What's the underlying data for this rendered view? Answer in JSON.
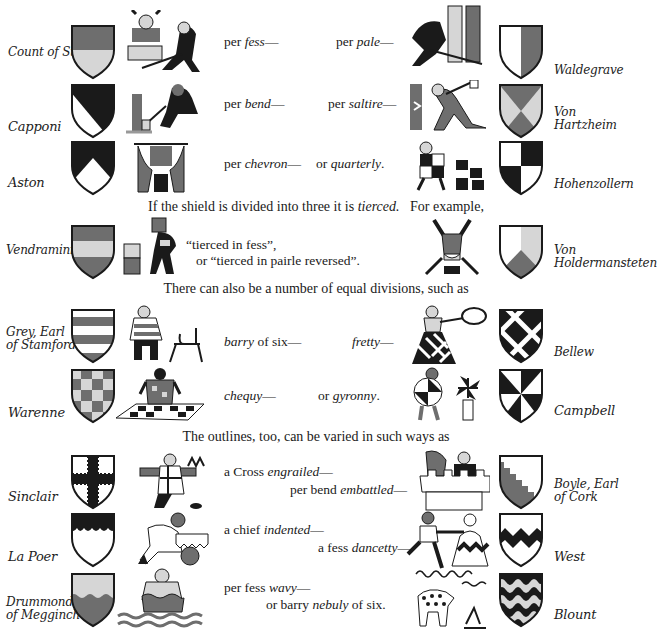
{
  "colors": {
    "ink": "#1a1a1a",
    "red": "#6e6e6e",
    "light": "#d6d6d6",
    "white": "#ffffff"
  },
  "rows": [
    {
      "left_name": "Count of Stockau",
      "left_pattern": "per-fess",
      "cap_left_pre": "per ",
      "cap_left_em": "fess",
      "cap_left_post": "—",
      "cap_right_pre": "per ",
      "cap_right_em": "pale",
      "cap_right_post": "—",
      "right_name": "Waldegrave",
      "right_pattern": "per-pale"
    },
    {
      "left_name": "Capponi",
      "left_pattern": "per-bend",
      "cap_left_pre": "per ",
      "cap_left_em": "bend",
      "cap_left_post": "—",
      "cap_right_pre": "per ",
      "cap_right_em": "saltire",
      "cap_right_post": "—",
      "right_name": "Von Hartzheim",
      "right_pattern": "per-saltire"
    },
    {
      "left_name": "Aston",
      "left_pattern": "per-chevron",
      "cap_left_pre": "per ",
      "cap_left_em": "chevron",
      "cap_left_post": "—",
      "cap_right_pre": "or ",
      "cap_right_em": "quarterly",
      "cap_right_post": ".",
      "right_name": "Hohenzollern",
      "right_pattern": "quarterly"
    }
  ],
  "tierced_intro": {
    "pre": "If the shield is divided into three it is ",
    "em": "tierced.",
    "post": "   For example,"
  },
  "tierced": {
    "left_name": "Vendramini",
    "left_pattern": "tierced-in-fess",
    "line1": "“tierced in fess”,",
    "line2": "or “tierced in pairle reversed”.",
    "right_name_1": "Von",
    "right_name_2": "Holdermansteten",
    "right_pattern": "tierced-in-pairle-reversed"
  },
  "divisions_intro": "There can also be a number of equal divisions, such as",
  "divisions": [
    {
      "left_name_1": "Grey, Earl",
      "left_name_2": "of Stamford",
      "left_pattern": "barry-of-six",
      "cap_left_em": "barry",
      "cap_left_post": " of six—",
      "cap_right_pre": "",
      "cap_right_em": "fretty",
      "cap_right_post": "—",
      "right_name": "Bellew",
      "right_pattern": "fretty"
    },
    {
      "left_name": "Warenne",
      "left_pattern": "chequy",
      "cap_left_em": "chequy",
      "cap_left_post": "—",
      "cap_right_pre": "or ",
      "cap_right_em": "gyronny",
      "cap_right_post": ".",
      "right_name": "Campbell",
      "right_pattern": "gyronny"
    }
  ],
  "outlines_intro": "The outlines, too, can be varied in such ways as",
  "outlines": [
    {
      "left_name": "Sinclair",
      "left_pattern": "cross-engrailed",
      "cap1_pre": "a Cross ",
      "cap1_em": "engrailed",
      "cap1_post": "—",
      "cap2_pre": "per bend ",
      "cap2_em": "embattled",
      "cap2_post": "—",
      "right_name_1": "Boyle, Earl",
      "right_name_2": "of Cork",
      "right_pattern": "per-bend-embattled"
    },
    {
      "left_name": "La Poer",
      "left_pattern": "chief-indented",
      "cap1_pre": "a chief ",
      "cap1_em": "indented",
      "cap1_post": "—",
      "cap2_pre": "a fess ",
      "cap2_em": "dancetty",
      "cap2_post": "—",
      "right_name": "West",
      "right_pattern": "fess-dancetty"
    },
    {
      "left_name_1": "Drummond",
      "left_name_2": "of Megginch",
      "left_pattern": "per-fess-wavy",
      "cap1_pre": "per fess ",
      "cap1_em": "wavy",
      "cap1_post": "—",
      "cap2_pre": "or barry ",
      "cap2_em": "nebuly",
      "cap2_post": " of six.",
      "right_name": "Blount",
      "right_pattern": "barry-nebuly"
    }
  ]
}
